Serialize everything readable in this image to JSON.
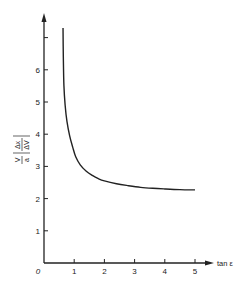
{
  "chart_data": {
    "type": "line",
    "title": "",
    "xlabel": "tan ε",
    "ylabel": "V/a |Δx/ΔV|",
    "ylabel_parts": {
      "num": "V",
      "den": "a",
      "abs_num": "Δx",
      "abs_den": "ΔV"
    },
    "origin_label": "0",
    "xlim": [
      0,
      5.6
    ],
    "ylim": [
      0,
      7.7
    ],
    "x_ticks": [
      1,
      2,
      3,
      4,
      5
    ],
    "x_tick_labels": [
      "1",
      "2",
      "3",
      "4",
      "5"
    ],
    "y_ticks": [
      1,
      2,
      3,
      4,
      5,
      6,
      7
    ],
    "y_tick_labels": [
      "1",
      "2",
      "3",
      "4",
      "5",
      "6",
      ""
    ],
    "grid": false,
    "legend": null,
    "series": [
      {
        "name": "curve",
        "x": [
          0.63,
          0.64,
          0.66,
          0.7,
          0.76,
          0.85,
          0.95,
          1.05,
          1.2,
          1.4,
          1.6,
          1.8,
          2.0,
          2.4,
          2.8,
          3.2,
          3.6,
          4.0,
          4.5,
          5.0
        ],
        "y": [
          7.3,
          6.4,
          5.5,
          4.9,
          4.4,
          3.95,
          3.6,
          3.3,
          3.05,
          2.85,
          2.72,
          2.62,
          2.55,
          2.46,
          2.4,
          2.35,
          2.32,
          2.3,
          2.28,
          2.27
        ]
      }
    ]
  }
}
